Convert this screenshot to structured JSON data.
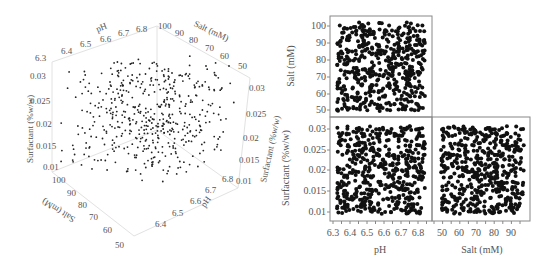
{
  "figure": {
    "left_panel": {
      "type": "scatter3d",
      "axes": {
        "ph": {
          "label": "pH",
          "ticks_top": [
            "6.3",
            "6.4",
            "6.5",
            "6.6",
            "6.7",
            "6.8"
          ],
          "ticks_bottom": [
            "6.4",
            "6.5",
            "6.6",
            "6.7",
            "6.8"
          ]
        },
        "salt": {
          "label": "Salt (mM)",
          "ticks_top": [
            "100",
            "90",
            "80",
            "70",
            "60",
            "50"
          ],
          "ticks_bottom": [
            "100",
            "90",
            "80",
            "70",
            "60",
            "50"
          ]
        },
        "surfactant": {
          "label": "Surfactant (%w/w)",
          "ticks_left": [
            "0.03",
            "0.025",
            "0.02",
            "0.015",
            "0.01"
          ],
          "ticks_right": [
            "0.03",
            "0.025",
            "0.02",
            "0.015",
            "0.01"
          ]
        }
      }
    },
    "right_panel": {
      "type": "scatter_matrix",
      "ylabel_top": "Salt (mM)",
      "ylabel_bottom": "Surfactant (%w/w)",
      "xlabel_left": "pH",
      "xlabel_right": "Salt (mM)",
      "salt_ticks": [
        "100",
        "90",
        "80",
        "70",
        "60",
        "50"
      ],
      "surf_ticks": [
        "0.03",
        "0.025",
        "0.02",
        "0.015",
        "0.01"
      ],
      "ph_ticks": [
        "6.3",
        "6.4",
        "6.5",
        "6.6",
        "6.7",
        "6.8"
      ],
      "salt_x_ticks": [
        "50",
        "60",
        "70",
        "80",
        "90"
      ]
    }
  },
  "chart_data": [
    {
      "type": "scatter",
      "title": "",
      "subtitle": "3D scatter of random design points",
      "xlabel": "pH",
      "ylabel": "Salt (mM)",
      "zlabel": "Surfactant (%w/w)",
      "xlim": [
        6.3,
        6.85
      ],
      "ylim": [
        50,
        100
      ],
      "zlim": [
        0.01,
        0.03
      ],
      "n_points_approx": 500,
      "distribution": "uniform random over the box",
      "grid": false
    },
    {
      "type": "scatter",
      "title": "Salt vs pH",
      "xlabel": "pH",
      "ylabel": "Salt (mM)",
      "xlim": [
        6.3,
        6.85
      ],
      "ylim": [
        48,
        102
      ],
      "xticks": [
        6.3,
        6.4,
        6.5,
        6.6,
        6.7,
        6.8
      ],
      "yticks": [
        50,
        60,
        70,
        80,
        90,
        100
      ],
      "n_points_approx": 500,
      "distribution": "uniform random",
      "grid": false
    },
    {
      "type": "scatter",
      "title": "Surfactant vs pH",
      "xlabel": "pH",
      "ylabel": "Surfactant (%w/w)",
      "xlim": [
        6.3,
        6.85
      ],
      "ylim": [
        0.008,
        0.032
      ],
      "xticks": [
        6.3,
        6.4,
        6.5,
        6.6,
        6.7,
        6.8
      ],
      "yticks": [
        0.01,
        0.015,
        0.02,
        0.025,
        0.03
      ],
      "n_points_approx": 500,
      "distribution": "uniform random",
      "grid": false
    },
    {
      "type": "scatter",
      "title": "Surfactant vs Salt",
      "xlabel": "Salt (mM)",
      "ylabel": "Surfactant (%w/w)",
      "xlim": [
        45,
        100
      ],
      "ylim": [
        0.008,
        0.032
      ],
      "xticks": [
        50,
        60,
        70,
        80,
        90
      ],
      "yticks": [
        0.01,
        0.015,
        0.02,
        0.025,
        0.03
      ],
      "n_points_approx": 500,
      "distribution": "uniform random",
      "grid": false
    }
  ]
}
